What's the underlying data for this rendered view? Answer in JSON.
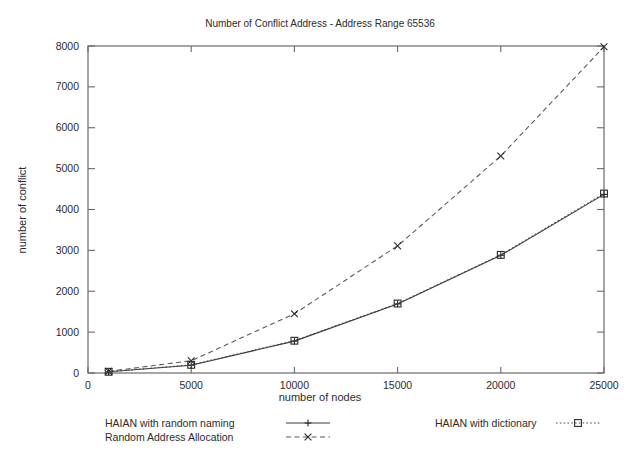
{
  "chart_data": {
    "type": "line",
    "title": "Number of Conflict Address - Address Range 65536",
    "xlabel": "number of nodes",
    "ylabel": "number of conflict",
    "xlim": [
      0,
      25000
    ],
    "ylim": [
      0,
      8000
    ],
    "xticks": [
      0,
      5000,
      10000,
      15000,
      20000,
      25000
    ],
    "xtick_labels": [
      "0",
      "5000",
      "10000",
      "15000",
      "20000",
      "25000"
    ],
    "yticks": [
      0,
      1000,
      2000,
      3000,
      4000,
      5000,
      6000,
      7000,
      8000
    ],
    "ytick_labels": [
      "0",
      "1000",
      "2000",
      "3000",
      "4000",
      "5000",
      "6000",
      "7000",
      "8000"
    ],
    "grid": false,
    "legend_position": "below-plot",
    "x": [
      1000,
      5000,
      10000,
      15000,
      20000,
      25000
    ],
    "series": [
      {
        "name": "HAIAN with random naming",
        "values": [
          30,
          190,
          780,
          1690,
          2880,
          4370
        ],
        "line_style": "solid",
        "marker": "plus"
      },
      {
        "name": "Random Address Allocation",
        "values": [
          40,
          300,
          1450,
          3110,
          5310,
          7980
        ],
        "line_style": "dashed",
        "marker": "cross"
      },
      {
        "name": "HAIAN with dictionary",
        "values": [
          30,
          200,
          790,
          1700,
          2890,
          4390
        ],
        "line_style": "dotted",
        "marker": "square"
      }
    ]
  },
  "legend": {
    "entries": [
      {
        "label": "HAIAN with random naming"
      },
      {
        "label": "Random Address Allocation"
      },
      {
        "label": "HAIAN with dictionary"
      }
    ]
  },
  "colors": {
    "background": "#ffffff",
    "axis": "#6a6a6a",
    "text": "#2b2b2b",
    "series": "#2a2a2a"
  }
}
